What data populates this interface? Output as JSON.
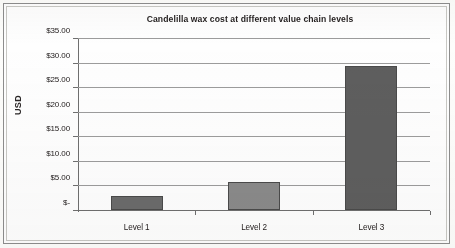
{
  "figure": {
    "name": "candelilla-wax-cost-bar-chart",
    "border_color": "#8d8d8d",
    "background": "#fefefe"
  },
  "chart_data": {
    "type": "bar",
    "title": "Candelilla wax cost  at different value chain levels",
    "xlabel": "",
    "ylabel": "USD",
    "categories": [
      "Level 1",
      "Level 2",
      "Level 3"
    ],
    "values": [
      2.9,
      5.7,
      29.4
    ],
    "series": [
      {
        "name": "Candelilla wax cost",
        "values": [
          2.9,
          5.7,
          29.4
        ]
      }
    ],
    "ylim": [
      0,
      35
    ],
    "ytick_values": [
      0,
      5,
      10,
      15,
      20,
      25,
      30,
      35
    ],
    "ytick_labels": [
      "$-",
      "$5.00",
      "$10.00",
      "$15.00",
      "$20.00",
      "$25.00",
      "$30.00",
      "$35.00"
    ],
    "grid": true,
    "grid_axis": "y",
    "legend": false,
    "legend_position": "none",
    "bar_colors": [
      "#6b6b6b",
      "#8a8a8a",
      "#5e5e5e"
    ],
    "bar_edge_color": "#4a4a4a",
    "gridline_color": "#9c9c9c",
    "axis_color": "#6f6f6f",
    "text_color": "#262121"
  }
}
